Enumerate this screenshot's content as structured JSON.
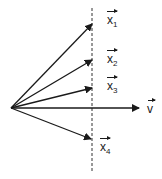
{
  "diagram": {
    "origin": {
      "x": 11,
      "y": 108
    },
    "dashed_line": {
      "x": 92,
      "y1": 8,
      "y2": 172
    },
    "vectors": [
      {
        "name": "x1",
        "label": "x",
        "subscript": "1",
        "tip": {
          "x": 92,
          "y": 24
        },
        "label_pos": {
          "x": 107,
          "y": 14
        }
      },
      {
        "name": "x2",
        "label": "x",
        "subscript": "2",
        "tip": {
          "x": 92,
          "y": 60
        },
        "label_pos": {
          "x": 107,
          "y": 53
        }
      },
      {
        "name": "x3",
        "label": "x",
        "subscript": "3",
        "tip": {
          "x": 92,
          "y": 88
        },
        "label_pos": {
          "x": 107,
          "y": 80
        }
      },
      {
        "name": "v",
        "label": "v",
        "subscript": "",
        "tip": {
          "x": 139,
          "y": 108
        },
        "label_pos": {
          "x": 147,
          "y": 103
        }
      },
      {
        "name": "x4",
        "label": "x",
        "subscript": "4",
        "tip": {
          "x": 91,
          "y": 139
        },
        "label_pos": {
          "x": 100,
          "y": 141
        }
      }
    ],
    "stroke_color": "#1a1a1a"
  }
}
